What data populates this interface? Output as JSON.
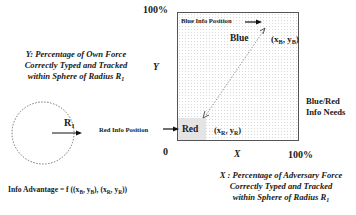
{
  "y_axis": {
    "top_label": "100%",
    "symbol": "Y",
    "description_lines": [
      "Y: Percentage of  Own Force",
      "Correctly Typed and Tracked",
      "within Sphere of Radius R"
    ],
    "radius_subscript": "1"
  },
  "x_axis": {
    "origin_label": "0",
    "symbol": "X",
    "right_label": "100%",
    "description_lines": [
      "X : Percentage of  Adversary Force",
      "Correctly Typed and Tracked",
      "within Sphere of Radius R"
    ],
    "radius_subscript": "1"
  },
  "blue": {
    "pointer_label": "Blue Info Position",
    "region_label": "Blue",
    "coord_x": "x",
    "coord_x_sub": "B",
    "coord_y": "y",
    "coord_y_sub": "B"
  },
  "red": {
    "pointer_label": "Red Info Position",
    "region_label": "Red",
    "coord_x": "x",
    "coord_x_sub": "R",
    "coord_y": "y",
    "coord_y_sub": "R"
  },
  "needs_label_lines": [
    "Blue/Red",
    "Info Needs"
  ],
  "sphere": {
    "radius_label": "R",
    "radius_subscript": "1"
  },
  "formula": {
    "prefix": "Info Advantage  =  f ((x",
    "sub1": "B",
    "mid1": ", y",
    "sub2": "B",
    "mid2": "), (x",
    "sub3": "R",
    "mid3": ", y",
    "sub4": "R",
    "suffix": "))"
  }
}
